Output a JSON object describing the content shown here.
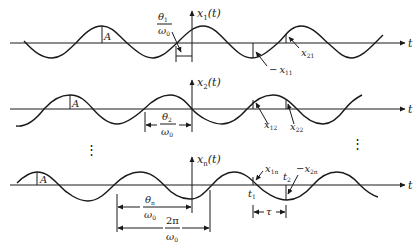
{
  "figure": {
    "rows": [
      {
        "id": "x1",
        "axis_label": "x",
        "axis_sub": "1",
        "axis_arg": "(t)",
        "t_label": "t",
        "amp_label": "A",
        "phase_num": "θ",
        "phase_sub": "1",
        "phase_den": "ω",
        "phase_den_sub": "0",
        "samples": [
          {
            "prefix": "−",
            "var": "x",
            "sub": "11"
          },
          {
            "prefix": "",
            "var": "x",
            "sub": "21"
          }
        ]
      },
      {
        "id": "x2",
        "axis_label": "x",
        "axis_sub": "2",
        "axis_arg": "(t)",
        "t_label": "t",
        "amp_label": "A",
        "phase_num": "θ",
        "phase_sub": "2",
        "phase_den": "ω",
        "phase_den_sub": "0",
        "samples": [
          {
            "prefix": "",
            "var": "x",
            "sub": "12"
          },
          {
            "prefix": "",
            "var": "x",
            "sub": "22"
          }
        ]
      },
      {
        "id": "xn",
        "axis_label": "x",
        "axis_sub": "n",
        "axis_arg": "(t)",
        "t_label": "t",
        "amp_label": "A",
        "phase_num": "θ",
        "phase_sub": "n",
        "phase_den": "ω",
        "phase_den_sub": "0",
        "period_num": "2π",
        "period_den": "ω",
        "period_den_sub": "0",
        "samples": [
          {
            "prefix": "",
            "var": "x",
            "sub": "1n"
          },
          {
            "prefix": "−",
            "var": "x",
            "sub": "2n"
          }
        ],
        "time_marks": [
          {
            "var": "t",
            "sub": "1"
          },
          {
            "var": "t",
            "sub": "2"
          }
        ],
        "interval_label": "τ"
      }
    ],
    "ellipsis": "⋮"
  }
}
